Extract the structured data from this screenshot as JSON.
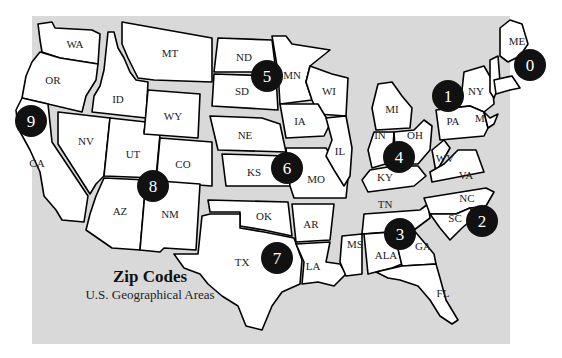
{
  "title": "Zip Codes",
  "subtitle": "U.S. Geographical Areas",
  "colors": {
    "background": "#d9d9d9",
    "state_fill": "#ffffff",
    "border": "#000000",
    "badge": "#111111",
    "badge_text": "#ffffff"
  },
  "states": {
    "WA": "WA",
    "OR": "OR",
    "CA": "CA",
    "ID": "ID",
    "NV": "NV",
    "UT": "UT",
    "AZ": "AZ",
    "MT": "MT",
    "WY": "WY",
    "CO": "CO",
    "NM": "NM",
    "ND": "ND",
    "SD": "SD",
    "MN": "MN",
    "WI": "WI",
    "NE": "NE",
    "IA": "IA",
    "IL": "IL",
    "KS": "KS",
    "MO": "MO",
    "OK": "OK",
    "AR": "AR",
    "TX": "TX",
    "LA": "LA",
    "MI": "MI",
    "IN": "IN",
    "OH": "OH",
    "KY": "KY",
    "TN": "TN",
    "MS": "MS",
    "ALA": "ALA",
    "GA": "GA",
    "FL": "FL",
    "WV": "WV",
    "VA": "VA",
    "NC": "NC",
    "SC": "SC",
    "NY": "NY",
    "PA": "PA",
    "MD": "M",
    "ME": "ME"
  },
  "zones": [
    {
      "digit": "0",
      "states": [
        "ME",
        "VT",
        "NH",
        "MA",
        "RI",
        "CT",
        "NJ"
      ]
    },
    {
      "digit": "1",
      "states": [
        "NY",
        "PA",
        "DE"
      ]
    },
    {
      "digit": "2",
      "states": [
        "DC",
        "MD",
        "NC",
        "SC",
        "VA",
        "WV"
      ]
    },
    {
      "digit": "3",
      "states": [
        "ALA",
        "FL",
        "GA",
        "MS",
        "TN"
      ]
    },
    {
      "digit": "4",
      "states": [
        "IN",
        "KY",
        "MI",
        "OH"
      ]
    },
    {
      "digit": "5",
      "states": [
        "IA",
        "MN",
        "MT",
        "ND",
        "SD",
        "WI"
      ]
    },
    {
      "digit": "6",
      "states": [
        "IL",
        "KS",
        "MO",
        "NE"
      ]
    },
    {
      "digit": "7",
      "states": [
        "AR",
        "LA",
        "OK",
        "TX"
      ]
    },
    {
      "digit": "8",
      "states": [
        "AZ",
        "CO",
        "ID",
        "NM",
        "NV",
        "UT",
        "WY"
      ]
    },
    {
      "digit": "9",
      "states": [
        "CA",
        "OR",
        "WA"
      ]
    }
  ]
}
